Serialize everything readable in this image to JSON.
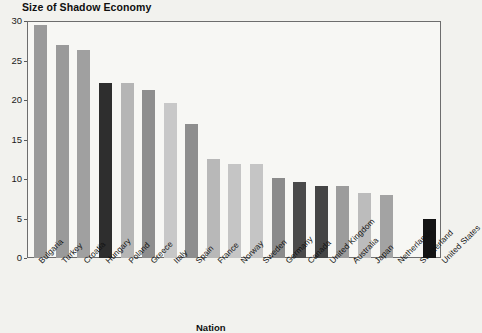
{
  "chart_data": {
    "type": "bar",
    "title": "Size of Shadow Economy",
    "xlabel": "Nation",
    "ylabel": "",
    "ylim": [
      0,
      30
    ],
    "yticks": [
      0,
      5,
      10,
      15,
      20,
      25,
      30
    ],
    "grid": false,
    "legend": "none",
    "categories": [
      "Bulgaria",
      "Turkey",
      "Croatia",
      "Hungary",
      "Poland",
      "Greece",
      "Italy",
      "Spain",
      "France",
      "Norway",
      "Sweden",
      "Germany",
      "Canada",
      "United Kingdom",
      "Australia",
      "Japan",
      "Netherlands",
      "Switzerland",
      "United States"
    ],
    "values": [
      29.6,
      27.1,
      26.4,
      22.3,
      22.2,
      21.4,
      19.7,
      17.0,
      12.6,
      12.0,
      11.9,
      10.2,
      9.6,
      9.1,
      9.1,
      8.3,
      8.0,
      0,
      4.9
    ],
    "bar_colors": [
      "#9a9a9a",
      "#9a9a9a",
      "#a0a0a0",
      "#2e2e2e",
      "#b5b5b5",
      "#8e8e8e",
      "#c8c8c8",
      "#8e8e8e",
      "#b8b8b8",
      "#c5c5c5",
      "#c5c5c5",
      "#8b8b8b",
      "#4a4a4a",
      "#454545",
      "#9c9c9c",
      "#bcbcbc",
      "#a3a3a3",
      "#f7f7f4",
      "#141414"
    ]
  },
  "axis": {
    "y_tick_labels": [
      "30",
      "25",
      "20",
      "15",
      "10",
      "5",
      "0"
    ]
  },
  "colors": {
    "background": "#f2f2ee",
    "plot_background": "#f7f7f4",
    "frame": "#6d6d6d",
    "text": "#111111"
  }
}
